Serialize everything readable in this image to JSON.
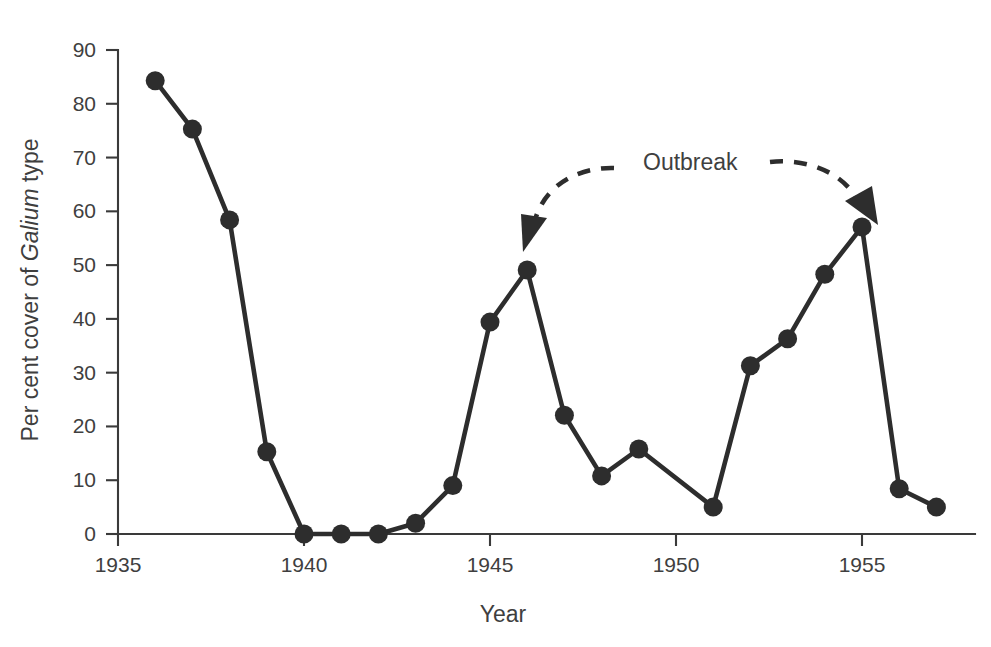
{
  "chart_data": {
    "type": "line",
    "title": "",
    "xlabel": "Year",
    "ylabel": "Per cent cover of Galium type",
    "ylabel_parts": [
      {
        "text": "Per cent cover of ",
        "style": "normal"
      },
      {
        "text": "Galium",
        "style": "italic"
      },
      {
        "text": " type",
        "style": "normal"
      }
    ],
    "x": [
      1936,
      1937,
      1938,
      1939,
      1940,
      1941,
      1942,
      1943,
      1944,
      1945,
      1946,
      1947,
      1948,
      1949,
      1950,
      1951,
      1952,
      1953,
      1954,
      1955,
      1956,
      1957
    ],
    "values": [
      84.3,
      75.3,
      58.4,
      15.3,
      0.0,
      0.0,
      0.0,
      2.0,
      9.0,
      39.4,
      49.1,
      22.1,
      10.8,
      15.8,
      null,
      5.0,
      31.3,
      36.3,
      48.3,
      57.1,
      8.4,
      5.0
    ],
    "series": [
      {
        "name": "Galium type cover",
        "points": [
          {
            "x": 1936,
            "y": 84.3
          },
          {
            "x": 1937,
            "y": 75.3
          },
          {
            "x": 1938,
            "y": 58.4
          },
          {
            "x": 1939,
            "y": 15.3
          },
          {
            "x": 1940,
            "y": 0.0
          },
          {
            "x": 1941,
            "y": 0.0
          },
          {
            "x": 1942,
            "y": 0.0
          },
          {
            "x": 1943,
            "y": 2.0
          },
          {
            "x": 1944,
            "y": 9.0
          },
          {
            "x": 1945,
            "y": 39.4
          },
          {
            "x": 1946,
            "y": 49.1
          },
          {
            "x": 1947,
            "y": 22.1
          },
          {
            "x": 1948,
            "y": 10.8
          },
          {
            "x": 1949,
            "y": 15.8
          },
          {
            "x": 1951,
            "y": 5.0
          },
          {
            "x": 1952,
            "y": 31.3
          },
          {
            "x": 1953,
            "y": 36.3
          },
          {
            "x": 1954,
            "y": 48.3
          },
          {
            "x": 1955,
            "y": 57.1
          },
          {
            "x": 1956,
            "y": 8.4
          },
          {
            "x": 1957,
            "y": 5.0
          }
        ]
      }
    ],
    "xlim": [
      1935,
      1957.6
    ],
    "ylim": [
      0,
      90
    ],
    "xticks": [
      1935,
      1940,
      1945,
      1950,
      1955
    ],
    "xtick_labels": [
      "1935",
      "1940",
      "1945",
      "1950",
      "1955"
    ],
    "yticks": [
      0,
      10,
      20,
      30,
      40,
      50,
      60,
      70,
      80,
      90
    ],
    "ytick_labels": [
      "0",
      "10",
      "20",
      "30",
      "40",
      "50",
      "60",
      "70",
      "80",
      "90"
    ],
    "grid": false,
    "legend": null,
    "annotations": [
      {
        "label": "Outbreak",
        "points_to_x": 1946,
        "points_to_y": 49.1
      },
      {
        "label": "Outbreak",
        "points_to_x": 1955,
        "points_to_y": 57.1
      }
    ],
    "annotation_label": "Outbreak",
    "colors": {
      "line": "#2d2d2d",
      "marker": "#2d2d2d",
      "axis": "#3a3a3a",
      "text": "#3f3f3f",
      "background": "#ffffff"
    }
  }
}
